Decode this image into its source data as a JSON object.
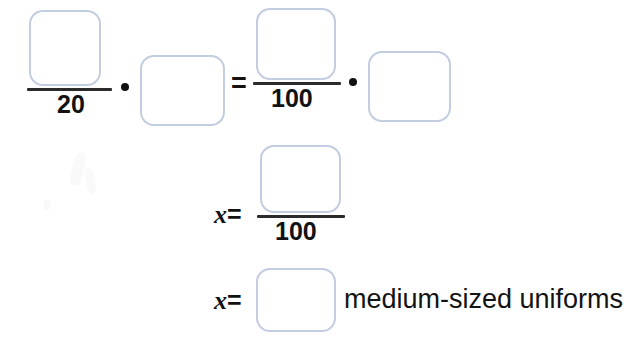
{
  "worksheet": {
    "type": "proportion-equation",
    "operators": {
      "multiply_symbol": "•",
      "equals_symbol": "=",
      "variable": "x"
    },
    "line1": {
      "left_fraction": {
        "numerator_value": "",
        "numerator_placeholder": "",
        "denominator": "20"
      },
      "multiply_1": "•",
      "factor_1": {
        "value": "",
        "placeholder": ""
      },
      "equals": "=",
      "right_fraction": {
        "numerator_value": "",
        "numerator_placeholder": "",
        "denominator": "100"
      },
      "multiply_2": "•",
      "factor_2": {
        "value": "",
        "placeholder": ""
      }
    },
    "line2": {
      "prefix_variable": "x",
      "prefix_equals": "=",
      "fraction": {
        "numerator_value": "",
        "numerator_placeholder": "",
        "denominator": "100"
      }
    },
    "line3": {
      "prefix_variable": "x",
      "prefix_equals": "=",
      "answer": {
        "value": "",
        "placeholder": ""
      },
      "unit_label": "medium-sized uniforms"
    }
  },
  "style": {
    "box_border_color": "#c3cde0",
    "ink_color": "#121212",
    "background_color": "#ffffff"
  }
}
